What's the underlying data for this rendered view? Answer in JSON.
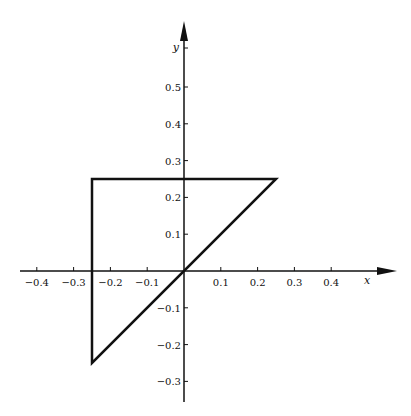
{
  "diagram": {
    "type": "coordinate-plot",
    "origin_px": [
      184,
      271
    ],
    "px_per_unit": 368,
    "x_axis": {
      "label": "x",
      "range_px": [
        20,
        397
      ],
      "ticks": [
        {
          "value": -0.4,
          "label": "−0.4"
        },
        {
          "value": -0.3,
          "label": "−0.3"
        },
        {
          "value": -0.2,
          "label": "−0.2"
        },
        {
          "value": -0.1,
          "label": "−0.1"
        },
        {
          "value": 0.1,
          "label": "0.1"
        },
        {
          "value": 0.2,
          "label": "0.2"
        },
        {
          "value": 0.3,
          "label": "0.3"
        },
        {
          "value": 0.4,
          "label": "0.4"
        }
      ]
    },
    "y_axis": {
      "label": "y",
      "range_px": [
        21,
        402
      ],
      "ticks": [
        {
          "value": 0.5,
          "label": "0.5"
        },
        {
          "value": 0.4,
          "label": "0.4"
        },
        {
          "value": 0.3,
          "label": "0.3"
        },
        {
          "value": 0.2,
          "label": "0.2"
        },
        {
          "value": 0.1,
          "label": "0.1"
        },
        {
          "value": -0.1,
          "label": "−0.1"
        },
        {
          "value": -0.2,
          "label": "−0.2"
        },
        {
          "value": -0.3,
          "label": "−0.3"
        }
      ]
    },
    "shapes": [
      {
        "name": "triangle",
        "vertices": [
          [
            -0.25,
            0.25
          ],
          [
            0.25,
            0.25
          ],
          [
            -0.25,
            -0.25
          ]
        ],
        "stroke": "#111111",
        "stroke_width": 2.5
      }
    ]
  },
  "chart_data": {
    "type": "line",
    "title": "",
    "xlabel": "x",
    "ylabel": "y",
    "xlim": [
      -0.45,
      0.55
    ],
    "ylim": [
      -0.35,
      0.68
    ],
    "grid": false,
    "series": [
      {
        "name": "triangle",
        "x": [
          -0.25,
          0.25,
          -0.25,
          -0.25
        ],
        "y": [
          0.25,
          0.25,
          -0.25,
          0.25
        ]
      }
    ],
    "x_ticks": [
      -0.4,
      -0.3,
      -0.2,
      -0.1,
      0.1,
      0.2,
      0.3,
      0.4
    ],
    "y_ticks": [
      -0.3,
      -0.2,
      -0.1,
      0.1,
      0.2,
      0.3,
      0.4,
      0.5
    ]
  }
}
